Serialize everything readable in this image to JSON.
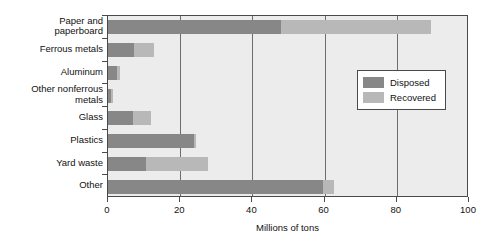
{
  "chart_data": {
    "type": "bar",
    "orientation": "horizontal",
    "stacked": true,
    "title": "",
    "xlabel": "Millions of tons",
    "ylabel": "",
    "xlim": [
      0,
      100
    ],
    "xticks": [
      0,
      20,
      40,
      60,
      80,
      100
    ],
    "grid": true,
    "legend_position": "center-right",
    "categories": [
      "Paper and\npaperboard",
      "Ferrous metals",
      "Aluminum",
      "Other nonferrous\nmetals",
      "Glass",
      "Plastics",
      "Yard waste",
      "Other"
    ],
    "series": [
      {
        "name": "Disposed",
        "color": "#878787",
        "values": [
          48.0,
          7.2,
          2.6,
          0.7,
          6.9,
          23.8,
          10.5,
          59.5
        ]
      },
      {
        "name": "Recovered",
        "color": "#b8b8b8",
        "values": [
          41.5,
          5.5,
          0.6,
          0.6,
          5.1,
          0.5,
          17.2,
          3.0
        ]
      }
    ],
    "totals": [
      89.5,
      12.7,
      3.2,
      1.3,
      12.0,
      24.3,
      27.7,
      62.5
    ]
  },
  "legend": {
    "items": [
      {
        "label": "Disposed"
      },
      {
        "label": "Recovered"
      }
    ]
  },
  "colors": {
    "disposed": "#878787",
    "recovered": "#b8b8b8",
    "plot_background": "#ececec",
    "axis": "#4a4a4a",
    "gridline": "#6d6d6d",
    "page_background": "#ffffff",
    "text": "#111111"
  }
}
